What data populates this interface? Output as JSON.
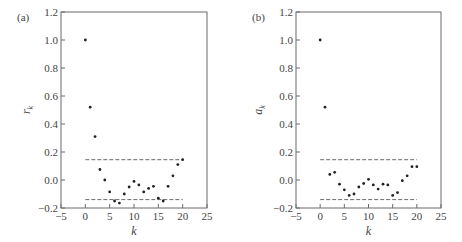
{
  "figure": {
    "width": 462,
    "height": 242,
    "colors": {
      "frame": "#6b6b6b",
      "text": "#444444",
      "point": "#222222",
      "bound": "#6b6b6b"
    }
  },
  "chart_data": [
    {
      "type": "scatter",
      "panel_label": "(a)",
      "title": "",
      "xlabel": "k",
      "ylabel": "r",
      "ylabel_subscript": "k",
      "xlim": [
        -5,
        25
      ],
      "ylim": [
        -0.2,
        1.2
      ],
      "xticks": [
        -5,
        0,
        5,
        10,
        15,
        20,
        25
      ],
      "xtick_labels": [
        "−5",
        "0",
        "5",
        "10",
        "15",
        "20",
        "25"
      ],
      "yticks": [
        -0.2,
        0.0,
        0.2,
        0.4,
        0.6,
        0.8,
        1.0,
        1.2
      ],
      "ytick_labels": [
        "−0.2",
        "0.0",
        "0.2",
        "0.4",
        "0.6",
        "0.8",
        "1.0",
        "1.2"
      ],
      "grid": false,
      "legend": null,
      "x": [
        0,
        1,
        2,
        3,
        4,
        5,
        6,
        7,
        8,
        9,
        10,
        11,
        12,
        13,
        14,
        15,
        16,
        17,
        18,
        19,
        20
      ],
      "values": [
        1.0,
        0.52,
        0.31,
        0.075,
        0.0,
        -0.085,
        -0.15,
        -0.165,
        -0.1,
        -0.05,
        -0.01,
        -0.035,
        -0.085,
        -0.06,
        -0.045,
        -0.13,
        -0.15,
        -0.045,
        0.03,
        0.11,
        0.145
      ],
      "confidence_bounds": [
        0.145,
        -0.14
      ],
      "bounds_x_range": [
        0,
        20
      ],
      "plot_box": {
        "left": 61,
        "right": 207,
        "top": 12,
        "bottom": 208
      },
      "ylabel_pos": {
        "x": 30,
        "y": 110
      }
    },
    {
      "type": "scatter",
      "panel_label": "(b)",
      "title": "",
      "xlabel": "k",
      "ylabel": "a",
      "ylabel_subscript": "k",
      "xlim": [
        -5,
        25
      ],
      "ylim": [
        -0.2,
        1.2
      ],
      "xticks": [
        -5,
        0,
        5,
        10,
        15,
        20,
        25
      ],
      "xtick_labels": [
        "−5",
        "0",
        "5",
        "10",
        "15",
        "20",
        "25"
      ],
      "yticks": [
        -0.2,
        0.0,
        0.2,
        0.4,
        0.6,
        0.8,
        1.0,
        1.2
      ],
      "ytick_labels": [
        "−0.2",
        "0.0",
        "0.2",
        "0.4",
        "0.6",
        "0.8",
        "1.0",
        "1.2"
      ],
      "grid": false,
      "legend": null,
      "x": [
        0,
        1,
        2,
        3,
        4,
        5,
        6,
        7,
        8,
        9,
        10,
        11,
        12,
        13,
        14,
        15,
        16,
        17,
        18,
        19,
        20
      ],
      "values": [
        1.0,
        0.52,
        0.04,
        0.055,
        -0.03,
        -0.07,
        -0.11,
        -0.1,
        -0.05,
        -0.025,
        0.005,
        -0.035,
        -0.065,
        -0.03,
        -0.035,
        -0.11,
        -0.09,
        -0.005,
        0.03,
        0.095,
        0.095
      ],
      "confidence_bounds": [
        0.145,
        -0.14
      ],
      "bounds_x_range": [
        0,
        20
      ],
      "plot_box": {
        "left": 296,
        "right": 441,
        "top": 12,
        "bottom": 208
      },
      "ylabel_pos": {
        "x": 262,
        "y": 110
      }
    }
  ]
}
